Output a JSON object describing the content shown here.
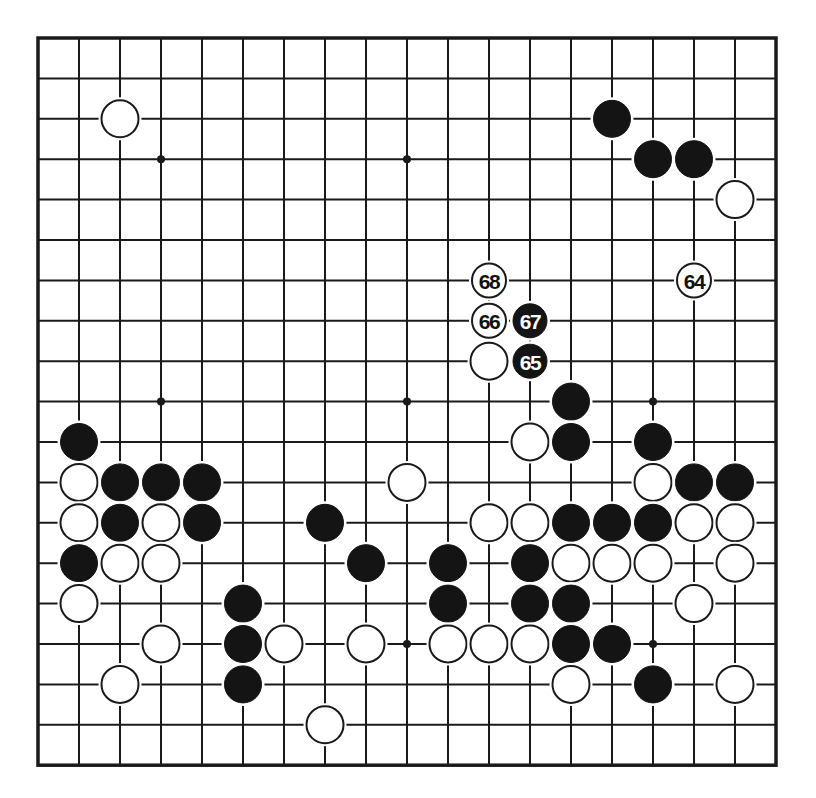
{
  "diagram": {
    "type": "go-board",
    "size": 19,
    "colors": {
      "line": "#1a1a1a",
      "black_stone": "#141414",
      "white_stone": "#ffffff",
      "background": "#ffffff"
    },
    "star_points": [
      [
        3,
        3
      ],
      [
        9,
        3
      ],
      [
        15,
        3
      ],
      [
        3,
        9
      ],
      [
        9,
        9
      ],
      [
        15,
        9
      ],
      [
        3,
        15
      ],
      [
        9,
        15
      ],
      [
        15,
        15
      ]
    ],
    "stones": [
      {
        "col": 2,
        "row": 2,
        "color": "white"
      },
      {
        "col": 14,
        "row": 2,
        "color": "black"
      },
      {
        "col": 15,
        "row": 3,
        "color": "black"
      },
      {
        "col": 16,
        "row": 3,
        "color": "black"
      },
      {
        "col": 17,
        "row": 4,
        "color": "white"
      },
      {
        "col": 11,
        "row": 6,
        "color": "white",
        "label": "68"
      },
      {
        "col": 16,
        "row": 6,
        "color": "white",
        "label": "64"
      },
      {
        "col": 11,
        "row": 7,
        "color": "white",
        "label": "66"
      },
      {
        "col": 12,
        "row": 7,
        "color": "black",
        "label": "67"
      },
      {
        "col": 11,
        "row": 8,
        "color": "white"
      },
      {
        "col": 12,
        "row": 8,
        "color": "black",
        "label": "65"
      },
      {
        "col": 13,
        "row": 9,
        "color": "black"
      },
      {
        "col": 1,
        "row": 10,
        "color": "black"
      },
      {
        "col": 12,
        "row": 10,
        "color": "white"
      },
      {
        "col": 13,
        "row": 10,
        "color": "black"
      },
      {
        "col": 15,
        "row": 10,
        "color": "black"
      },
      {
        "col": 1,
        "row": 11,
        "color": "white"
      },
      {
        "col": 2,
        "row": 11,
        "color": "black"
      },
      {
        "col": 3,
        "row": 11,
        "color": "black"
      },
      {
        "col": 4,
        "row": 11,
        "color": "black"
      },
      {
        "col": 9,
        "row": 11,
        "color": "white"
      },
      {
        "col": 15,
        "row": 11,
        "color": "white"
      },
      {
        "col": 16,
        "row": 11,
        "color": "black"
      },
      {
        "col": 17,
        "row": 11,
        "color": "black"
      },
      {
        "col": 1,
        "row": 12,
        "color": "white"
      },
      {
        "col": 2,
        "row": 12,
        "color": "black"
      },
      {
        "col": 3,
        "row": 12,
        "color": "white"
      },
      {
        "col": 4,
        "row": 12,
        "color": "black"
      },
      {
        "col": 7,
        "row": 12,
        "color": "black"
      },
      {
        "col": 11,
        "row": 12,
        "color": "white"
      },
      {
        "col": 12,
        "row": 12,
        "color": "white"
      },
      {
        "col": 13,
        "row": 12,
        "color": "black"
      },
      {
        "col": 14,
        "row": 12,
        "color": "black"
      },
      {
        "col": 15,
        "row": 12,
        "color": "black"
      },
      {
        "col": 16,
        "row": 12,
        "color": "white"
      },
      {
        "col": 17,
        "row": 12,
        "color": "white"
      },
      {
        "col": 1,
        "row": 13,
        "color": "black"
      },
      {
        "col": 2,
        "row": 13,
        "color": "white"
      },
      {
        "col": 3,
        "row": 13,
        "color": "white"
      },
      {
        "col": 8,
        "row": 13,
        "color": "black"
      },
      {
        "col": 10,
        "row": 13,
        "color": "black"
      },
      {
        "col": 12,
        "row": 13,
        "color": "black"
      },
      {
        "col": 13,
        "row": 13,
        "color": "white"
      },
      {
        "col": 14,
        "row": 13,
        "color": "white"
      },
      {
        "col": 15,
        "row": 13,
        "color": "white"
      },
      {
        "col": 17,
        "row": 13,
        "color": "white"
      },
      {
        "col": 1,
        "row": 14,
        "color": "white"
      },
      {
        "col": 5,
        "row": 14,
        "color": "black"
      },
      {
        "col": 10,
        "row": 14,
        "color": "black"
      },
      {
        "col": 12,
        "row": 14,
        "color": "black"
      },
      {
        "col": 13,
        "row": 14,
        "color": "black"
      },
      {
        "col": 16,
        "row": 14,
        "color": "white"
      },
      {
        "col": 3,
        "row": 15,
        "color": "white"
      },
      {
        "col": 5,
        "row": 15,
        "color": "black"
      },
      {
        "col": 6,
        "row": 15,
        "color": "white"
      },
      {
        "col": 8,
        "row": 15,
        "color": "white"
      },
      {
        "col": 10,
        "row": 15,
        "color": "white"
      },
      {
        "col": 11,
        "row": 15,
        "color": "white"
      },
      {
        "col": 12,
        "row": 15,
        "color": "white"
      },
      {
        "col": 13,
        "row": 15,
        "color": "black"
      },
      {
        "col": 14,
        "row": 15,
        "color": "black"
      },
      {
        "col": 2,
        "row": 16,
        "color": "white"
      },
      {
        "col": 5,
        "row": 16,
        "color": "black"
      },
      {
        "col": 13,
        "row": 16,
        "color": "white"
      },
      {
        "col": 15,
        "row": 16,
        "color": "black"
      },
      {
        "col": 17,
        "row": 16,
        "color": "white"
      },
      {
        "col": 7,
        "row": 17,
        "color": "white"
      }
    ],
    "move_labels": [
      "64",
      "65",
      "66",
      "67",
      "68"
    ]
  }
}
